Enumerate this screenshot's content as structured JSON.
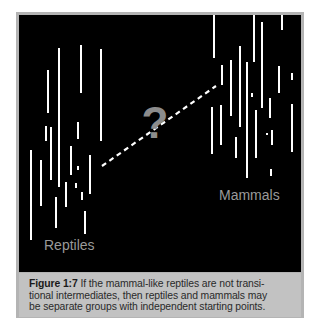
{
  "figure": {
    "number_label": "Figure 1:7",
    "caption": " If the mammal-like reptiles are not transi-tional intermediates, then reptiles and mammals may be separate groups with independent starting points.",
    "caption_lines": [
      "If the mammal-like reptiles are not transi-",
      "tional intermediates, then reptiles and mammals may",
      "be separate groups with independent starting points."
    ],
    "labels": {
      "left_group": "Reptiles",
      "right_group": "Mammals",
      "center_symbol": "?"
    },
    "colors": {
      "panel_background": "#000000",
      "lines": "#ffffff",
      "labels": "#9a9a9a",
      "question_mark": "#8c8c8c",
      "caption_background": "#c2c2c2",
      "frame": "#b4b4b4"
    },
    "reptile_lines": [
      {
        "x": 31,
        "y1": 150,
        "y2": 240
      },
      {
        "x": 41,
        "y1": 160,
        "y2": 206
      },
      {
        "x": 48,
        "y1": 70,
        "y2": 113
      },
      {
        "x": 46,
        "y1": 126,
        "y2": 141
      },
      {
        "x": 51,
        "y1": 127,
        "y2": 180
      },
      {
        "x": 59,
        "y1": 48,
        "y2": 187
      },
      {
        "x": 56,
        "y1": 197,
        "y2": 228
      },
      {
        "x": 66,
        "y1": 182,
        "y2": 207
      },
      {
        "x": 71,
        "y1": 146,
        "y2": 175
      },
      {
        "x": 78,
        "y1": 122,
        "y2": 139
      },
      {
        "x": 81,
        "y1": 45,
        "y2": 93
      },
      {
        "x": 78,
        "y1": 166,
        "y2": 170
      },
      {
        "x": 76,
        "y1": 183,
        "y2": 188
      },
      {
        "x": 82,
        "y1": 192,
        "y2": 200
      },
      {
        "x": 85,
        "y1": 211,
        "y2": 234
      },
      {
        "x": 90,
        "y1": 155,
        "y2": 194
      },
      {
        "x": 101,
        "y1": 49,
        "y2": 141
      }
    ],
    "mammal_lines": [
      {
        "x": 214,
        "y1": 15,
        "y2": 58
      },
      {
        "x": 222,
        "y1": 65,
        "y2": 85
      },
      {
        "x": 212,
        "y1": 107,
        "y2": 154
      },
      {
        "x": 221,
        "y1": 105,
        "y2": 145
      },
      {
        "x": 231,
        "y1": 60,
        "y2": 116
      },
      {
        "x": 236,
        "y1": 137,
        "y2": 158
      },
      {
        "x": 240,
        "y1": 46,
        "y2": 127
      },
      {
        "x": 247,
        "y1": 62,
        "y2": 178
      },
      {
        "x": 254,
        "y1": 15,
        "y2": 62
      },
      {
        "x": 252,
        "y1": 93,
        "y2": 97
      },
      {
        "x": 256,
        "y1": 110,
        "y2": 158
      },
      {
        "x": 262,
        "y1": 22,
        "y2": 108
      },
      {
        "x": 270,
        "y1": 98,
        "y2": 118
      },
      {
        "x": 267,
        "y1": 133,
        "y2": 135
      },
      {
        "x": 272,
        "y1": 130,
        "y2": 145
      },
      {
        "x": 271,
        "y1": 169,
        "y2": 176
      },
      {
        "x": 279,
        "y1": 66,
        "y2": 93
      },
      {
        "x": 282,
        "y1": 15,
        "y2": 30
      },
      {
        "x": 292,
        "y1": 73,
        "y2": 80
      },
      {
        "x": 292,
        "y1": 104,
        "y2": 152
      }
    ],
    "connector": {
      "x1": 102,
      "y1": 166,
      "x2": 216,
      "y2": 86,
      "style": "dashed"
    }
  }
}
